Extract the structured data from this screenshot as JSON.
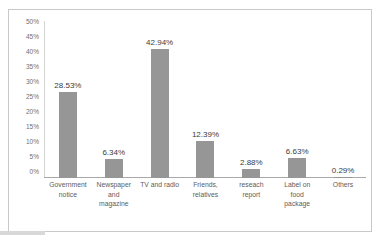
{
  "chart_data": {
    "type": "bar",
    "title": "",
    "subtitle": "",
    "xlabel": "",
    "ylabel": "",
    "ylim": [
      0,
      50
    ],
    "ytick_step": 5,
    "grid": false,
    "legend": "none",
    "orientation": "vertical",
    "value_suffix": "%",
    "bar_color": "#969696",
    "categories": [
      "Government notice",
      "Newspaper and magazine",
      "TV and radio",
      "Friends, relatives",
      "reseach report",
      "Label on food package",
      "Others"
    ],
    "values": [
      28.53,
      6.34,
      42.94,
      12.39,
      2.88,
      6.63,
      0.29
    ],
    "data_labels": [
      "28.53%",
      "6.34%",
      "42.94%",
      "12.39%",
      "2.88%",
      "6.63%",
      "0.29%"
    ],
    "ytick_labels": [
      "50%",
      "45%",
      "40%",
      "35%",
      "30%",
      "25%",
      "20%",
      "15%",
      "10%",
      "5%",
      "0%"
    ],
    "ytick_values": [
      50,
      45,
      40,
      35,
      30,
      25,
      20,
      15,
      10,
      5,
      0
    ],
    "category_label_lines": [
      [
        "Government",
        "notice"
      ],
      [
        "Newspaper",
        "and",
        "magazine"
      ],
      [
        "TV and radio"
      ],
      [
        "Friends,",
        "relatives"
      ],
      [
        "reseach",
        "report"
      ],
      [
        "Label on",
        "food",
        "package"
      ],
      [
        "Others"
      ]
    ]
  },
  "colors": {
    "bar": "#969696",
    "axis": "#a9a9a9",
    "tick_text": "#6f6f6f",
    "label_text": "#5d5d5d",
    "value_text": "#3b3b3b",
    "card_border": "#c9c9c9"
  }
}
